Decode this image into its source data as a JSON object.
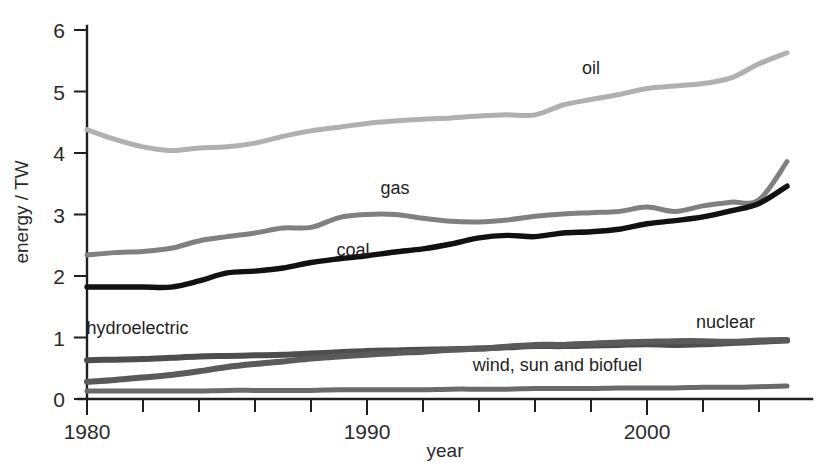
{
  "chart_data": {
    "type": "line",
    "title": "",
    "xlabel": "year",
    "ylabel": "energy / TW",
    "xlim": [
      1980,
      2005
    ],
    "ylim": [
      0,
      6.3
    ],
    "grid": false,
    "legend_position": "inline-labels",
    "x_ticks_major": [
      1980,
      1990,
      2000
    ],
    "x_tick_labels": [
      "1980",
      "1990",
      "2000"
    ],
    "x_ticks_minor": [
      1982,
      1984,
      1986,
      1988,
      1992,
      1994,
      1996,
      1998,
      2002,
      2004
    ],
    "y_ticks": [
      0,
      1,
      2,
      3,
      4,
      5,
      6
    ],
    "y_tick_labels": [
      "0",
      "1",
      "2",
      "3",
      "4",
      "5",
      "6"
    ],
    "x": [
      1980,
      1981,
      1982,
      1983,
      1984,
      1985,
      1986,
      1987,
      1988,
      1989,
      1990,
      1991,
      1992,
      1993,
      1994,
      1995,
      1996,
      1997,
      1998,
      1999,
      2000,
      2001,
      2002,
      2003,
      2004,
      2005
    ],
    "series": [
      {
        "name": "oil",
        "label": "oil",
        "color": "#b0b0b0",
        "width": 5.0,
        "label_x": 1998.0,
        "label_y": 5.28,
        "values": [
          4.38,
          4.22,
          4.1,
          4.04,
          4.08,
          4.1,
          4.16,
          4.27,
          4.36,
          4.42,
          4.48,
          4.52,
          4.55,
          4.57,
          4.6,
          4.62,
          4.62,
          4.78,
          4.87,
          4.95,
          5.05,
          5.09,
          5.13,
          5.22,
          5.45,
          5.63
        ]
      },
      {
        "name": "gas",
        "label": "gas",
        "color": "#808080",
        "width": 5.0,
        "label_x": 1991.0,
        "label_y": 3.33,
        "values": [
          2.34,
          2.38,
          2.4,
          2.45,
          2.57,
          2.64,
          2.7,
          2.78,
          2.79,
          2.95,
          3.0,
          3.0,
          2.94,
          2.89,
          2.88,
          2.91,
          2.97,
          3.01,
          3.03,
          3.05,
          3.12,
          3.05,
          3.14,
          3.2,
          3.24,
          3.86
        ]
      },
      {
        "name": "coal",
        "label": "coal",
        "color": "#111111",
        "width": 5.4,
        "label_x": 1989.5,
        "label_y": 2.32,
        "values": [
          1.82,
          1.82,
          1.82,
          1.82,
          1.92,
          2.05,
          2.08,
          2.13,
          2.22,
          2.28,
          2.33,
          2.39,
          2.44,
          2.52,
          2.62,
          2.66,
          2.64,
          2.7,
          2.72,
          2.76,
          2.85,
          2.9,
          2.96,
          3.06,
          3.18,
          3.46
        ]
      },
      {
        "name": "hydroelectric",
        "label": "hydroelectric",
        "color": "#4d4d4d",
        "width": 6.0,
        "label_x": 1981.8,
        "label_y": 1.06,
        "values": [
          0.63,
          0.64,
          0.65,
          0.67,
          0.69,
          0.7,
          0.71,
          0.72,
          0.74,
          0.76,
          0.78,
          0.79,
          0.8,
          0.81,
          0.82,
          0.84,
          0.86,
          0.86,
          0.87,
          0.88,
          0.89,
          0.88,
          0.89,
          0.91,
          0.93,
          0.95
        ]
      },
      {
        "name": "nuclear",
        "label": "nuclear",
        "color": "#5a5a5a",
        "width": 6.0,
        "label_x": 2002.8,
        "label_y": 1.16,
        "values": [
          0.28,
          0.31,
          0.35,
          0.39,
          0.45,
          0.52,
          0.57,
          0.61,
          0.66,
          0.69,
          0.72,
          0.75,
          0.77,
          0.8,
          0.82,
          0.85,
          0.88,
          0.88,
          0.9,
          0.92,
          0.93,
          0.94,
          0.94,
          0.93,
          0.95,
          0.96
        ]
      },
      {
        "name": "wind, sun and biofuel",
        "label": "wind, sun and biofuel",
        "color": "#6a6a6a",
        "width": 5.0,
        "label_x": 1996.8,
        "label_y": 0.45,
        "values": [
          0.13,
          0.13,
          0.13,
          0.13,
          0.13,
          0.14,
          0.14,
          0.14,
          0.14,
          0.15,
          0.15,
          0.15,
          0.15,
          0.16,
          0.16,
          0.16,
          0.17,
          0.17,
          0.17,
          0.18,
          0.18,
          0.18,
          0.19,
          0.19,
          0.2,
          0.21
        ]
      }
    ]
  }
}
